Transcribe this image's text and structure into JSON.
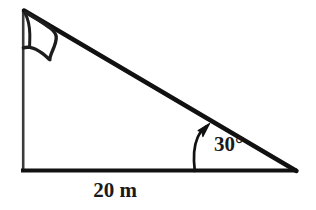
{
  "figure": {
    "background_color": "#ffffff",
    "line_color": "#111111",
    "pole_color": "#3a3a3a",
    "width": 316,
    "height": 210
  },
  "labels": {
    "angle": "30°",
    "base": "20 m"
  },
  "geometry": {
    "top_vertex": [
      23,
      9
    ],
    "bottom_left_vertex": [
      23,
      172
    ],
    "bottom_right_vertex": [
      297,
      172
    ],
    "base_stroke_width": 4,
    "hypotenuse_stroke_width": 4.5,
    "pole_stroke_width": 2.6
  },
  "flag": {
    "description": "hand-drawn pennant outline attached to the top of the vertical pole",
    "tip": [
      56,
      39
    ],
    "outline_stroke_width": 3.4
  },
  "angle_arrow": {
    "description": "curved arrow from the base line up to the hypotenuse indicating the angle of elevation",
    "start": [
      195,
      171
    ],
    "tip": [
      208,
      126
    ],
    "stroke_width": 2.6
  },
  "annotations": {
    "angle_label_position": [
      214,
      151
    ],
    "base_label_position": [
      115,
      196
    ]
  }
}
